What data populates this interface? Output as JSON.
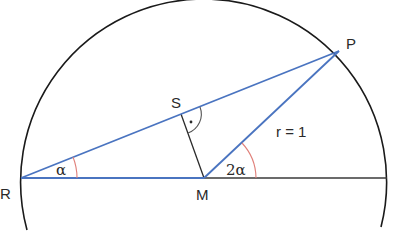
{
  "diagram": {
    "type": "geometry",
    "colors": {
      "circle": "#1a1a1a",
      "blue_lines": "#4a74c0",
      "black_lines": "#2a2a2a",
      "angle_arc": "#e0807a",
      "right_angle_arc": "#555555"
    },
    "points": {
      "M": {
        "label": "M",
        "x": 204,
        "y": 178
      },
      "R": {
        "label": "R",
        "x": 21,
        "y": 178
      },
      "P": {
        "label": "P",
        "x": 339,
        "y": 51
      },
      "S": {
        "label": "S",
        "x": 181,
        "y": 114
      },
      "E": {
        "x": 387,
        "y": 178
      }
    },
    "circle": {
      "cx": 204,
      "cy": 178,
      "r": 183
    },
    "labels": {
      "P": "P",
      "S": "S",
      "R": "R",
      "M": "M",
      "radius": "r = 1",
      "alpha": "α",
      "two_alpha": "2α"
    },
    "angles": [
      {
        "vertex": "R",
        "label": "α"
      },
      {
        "vertex": "M",
        "label": "2α"
      },
      {
        "vertex": "S",
        "label": "right angle",
        "marker": "dot"
      }
    ]
  }
}
